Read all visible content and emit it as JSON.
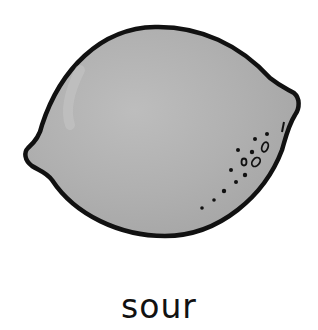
{
  "illustration": {
    "subject": "lemon",
    "icon": "lemon-icon",
    "fill_color": "#b3b3b3",
    "outline_color": "#111111"
  },
  "caption": {
    "text": "sour"
  }
}
